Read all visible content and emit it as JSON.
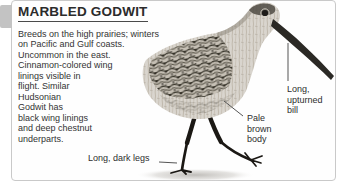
{
  "card": {
    "title": "MARBLED GODWIT",
    "description": "Breeds on the high prairies; winters\non Pacific and Gulf coasts.\nUncommon in the east.\nCinnamon-colored wing\nlinings visible in\nflight. Similar\nHudsonian\nGodwit has\nblack wing linings\nand deep chestnut\nunderparts."
  },
  "callouts": {
    "bill": "Long,\nupturned\nbill",
    "body": "Pale\nbrown\nbody",
    "legs": "Long, dark legs"
  },
  "illustration": {
    "subject": "grayscale photo of a Marbled Godwit shorebird standing, facing right, long upturned bill, one leg raised"
  },
  "colors": {
    "title_text": "#2b2b2b",
    "body_text": "#333333",
    "card_border": "#c9c9c9",
    "side_tab": "#c3c3c3",
    "callout_line": "#555555",
    "bird_light_plumage": "#d9d5ce",
    "bird_dark_mottling": "#3c392f",
    "bird_legs": "#1b1814"
  }
}
